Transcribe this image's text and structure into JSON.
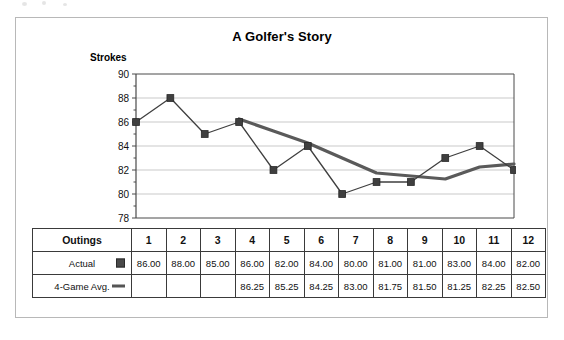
{
  "chart_data": {
    "type": "line",
    "title": "A Golfer's Story",
    "xlabel": "",
    "ylabel": "Strokes",
    "ylim": [
      78,
      90
    ],
    "yticks": [
      78,
      80,
      82,
      84,
      86,
      88,
      90
    ],
    "grid": true,
    "legend_position": "table",
    "categories": [
      "1",
      "2",
      "3",
      "4",
      "5",
      "6",
      "7",
      "8",
      "9",
      "10",
      "11",
      "12"
    ],
    "series": [
      {
        "name": "Actual",
        "marker": "square",
        "color": "#3f3f3f",
        "values": [
          86.0,
          88.0,
          85.0,
          86.0,
          82.0,
          84.0,
          80.0,
          81.0,
          81.0,
          83.0,
          84.0,
          82.0
        ]
      },
      {
        "name": "4-Game Avg.",
        "marker": "line",
        "color": "#5a5a5a",
        "values": [
          null,
          null,
          null,
          86.25,
          85.25,
          84.25,
          83.0,
          81.75,
          81.5,
          81.25,
          82.25,
          82.5
        ]
      }
    ]
  },
  "axis": {
    "y_caption": "Strokes",
    "y_tick_labels": [
      "90",
      "88",
      "86",
      "84",
      "82",
      "80",
      "78"
    ]
  },
  "table": {
    "header_label": "Outings",
    "columns": [
      "1",
      "2",
      "3",
      "4",
      "5",
      "6",
      "7",
      "8",
      "9",
      "10",
      "11",
      "12"
    ],
    "rows": [
      {
        "label": "Actual",
        "key": "square-marker-icon",
        "cells": [
          "86.00",
          "88.00",
          "85.00",
          "86.00",
          "82.00",
          "84.00",
          "80.00",
          "81.00",
          "81.00",
          "83.00",
          "84.00",
          "82.00"
        ]
      },
      {
        "label": "4-Game Avg.",
        "key": "line-marker-icon",
        "cells": [
          "",
          "",
          "",
          "86.25",
          "85.25",
          "84.25",
          "83.00",
          "81.75",
          "81.50",
          "81.25",
          "82.25",
          "82.50"
        ]
      }
    ]
  },
  "colors": {
    "actual_series": "#3f3f3f",
    "average_series": "#5a5a5a",
    "gridline": "#c9c9c9",
    "axis": "#4a4a4a",
    "frame": "#b8b8b8"
  }
}
